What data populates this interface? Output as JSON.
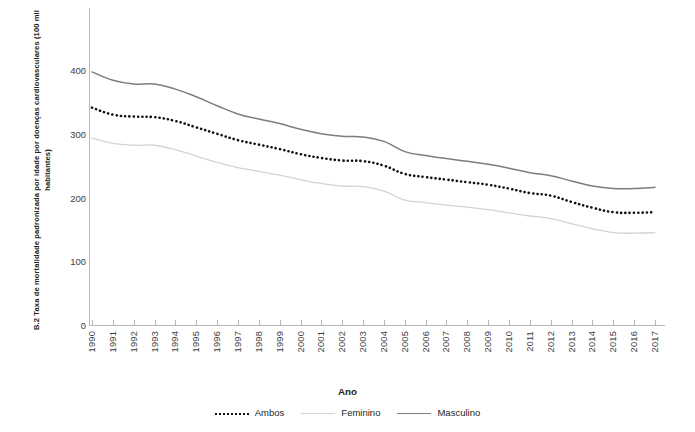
{
  "chart_data": {
    "type": "line",
    "title": "",
    "xlabel": "Ano",
    "ylabel": "B.2 Taxa de mortalidade padronizada por idade por doenças cardiovasculares (100 mil habitantes)",
    "xlim": [
      1990,
      2017
    ],
    "ylim": [
      0,
      430
    ],
    "yticks": [
      0,
      100,
      200,
      300,
      400
    ],
    "ytick_labels": [
      "0",
      "100",
      "200",
      "300",
      "400"
    ],
    "grid": false,
    "legend_position": "bottom",
    "categories": [
      1990,
      1991,
      1992,
      1993,
      1994,
      1995,
      1996,
      1997,
      1998,
      1999,
      2000,
      2001,
      2002,
      2003,
      2004,
      2005,
      2006,
      2007,
      2008,
      2009,
      2010,
      2011,
      2012,
      2013,
      2014,
      2015,
      2016,
      2017
    ],
    "xtick_labels": [
      "1990",
      "1991",
      "1992",
      "1993",
      "1994",
      "1995",
      "1996",
      "1997",
      "1998",
      "1999",
      "2000",
      "2001",
      "2002",
      "2003",
      "2004",
      "2005",
      "2006",
      "2007",
      "2008",
      "2009",
      "2010",
      "2011",
      "2012",
      "2013",
      "2014",
      "2015",
      "2016",
      "2017"
    ],
    "series": [
      {
        "name": "Ambos",
        "style": "dotted",
        "color": "#111111",
        "values": [
          341,
          330,
          327,
          326,
          320,
          310,
          300,
          290,
          283,
          276,
          268,
          262,
          258,
          257,
          250,
          237,
          232,
          228,
          224,
          220,
          214,
          207,
          203,
          193,
          184,
          177,
          176,
          177
        ]
      },
      {
        "name": "Feminino",
        "style": "solid",
        "color": "#d3d3d3",
        "values": [
          293,
          285,
          282,
          282,
          275,
          265,
          255,
          247,
          241,
          235,
          228,
          222,
          218,
          217,
          210,
          196,
          192,
          188,
          185,
          181,
          176,
          171,
          167,
          159,
          151,
          145,
          144,
          145
        ]
      },
      {
        "name": "Masculino",
        "style": "solid",
        "color": "#7d7d7d",
        "values": [
          397,
          384,
          378,
          378,
          370,
          358,
          344,
          331,
          323,
          316,
          307,
          300,
          296,
          295,
          288,
          272,
          266,
          261,
          257,
          252,
          246,
          239,
          234,
          226,
          218,
          214,
          214,
          216
        ]
      }
    ],
    "legend": [
      "Ambos",
      "Feminino",
      "Masculino"
    ]
  }
}
